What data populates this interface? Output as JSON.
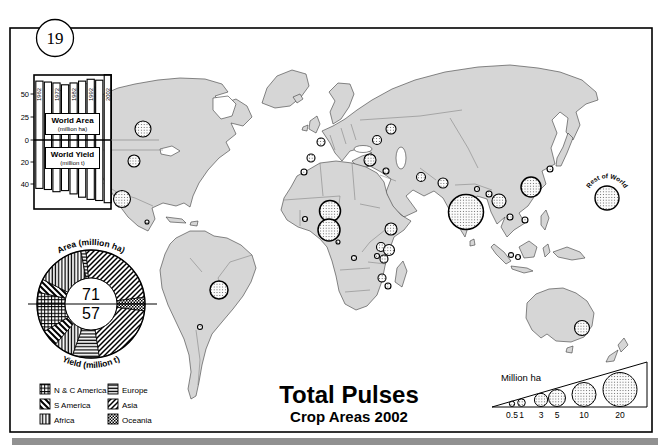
{
  "figure": {
    "number": "19",
    "title": "Total Pulses",
    "subtitle": "Crop Areas 2002"
  },
  "colors": {
    "land": "#d6d6d6",
    "coast": "#3a3a3a",
    "inner_border": "#6a6a6a",
    "frame": "#000000",
    "bubble_dot": "#444444",
    "bottom_band": "#919191"
  },
  "legend": {
    "items": [
      {
        "label": "N & C America",
        "pattern": "grid"
      },
      {
        "label": "S America",
        "pattern": "bdiag"
      },
      {
        "label": "Africa",
        "pattern": "vlines"
      },
      {
        "label": "Europe",
        "pattern": "hlines"
      },
      {
        "label": "Asia",
        "pattern": "fdiag"
      },
      {
        "label": "Oceania",
        "pattern": "dense"
      }
    ]
  },
  "chart_data": [
    {
      "type": "bar",
      "title": "World Area and World Yield of pulses by year",
      "top_series": {
        "name": "World Area",
        "unit": "(million ha)"
      },
      "bottom_series": {
        "name": "World Yield",
        "unit": "(million t)"
      },
      "years": [
        1962,
        1967,
        1972,
        1977,
        1982,
        1987,
        1992,
        1997,
        2002
      ],
      "area_million_ha": [
        64,
        63,
        62,
        60,
        62,
        64,
        66,
        65,
        71
      ],
      "yield_million_t": [
        44,
        45,
        47,
        46,
        49,
        52,
        54,
        55,
        57
      ],
      "y_ticks_top": [
        50,
        25,
        0
      ],
      "y_ticks_bottom": [
        20,
        40
      ],
      "ylim_top": [
        0,
        72
      ],
      "ylim_bottom": [
        0,
        60
      ],
      "grid": false,
      "year_labels_shown": [
        1962,
        1972,
        1982,
        1992,
        2002
      ]
    },
    {
      "type": "pie",
      "top_label": "Area (million ha)",
      "bottom_label": "Yield (million t)",
      "area_total": 71,
      "yield_total": 57,
      "regions": [
        "N & C America",
        "S America",
        "Africa",
        "Europe",
        "Asia",
        "Oceania"
      ],
      "patterns": [
        "grid",
        "bdiag",
        "vlines",
        "hlines",
        "fdiag",
        "dense"
      ],
      "area_pct": [
        7,
        8,
        29,
        3,
        49,
        4
      ],
      "yield_pct": [
        17,
        10,
        12,
        16,
        41,
        4
      ]
    },
    {
      "type": "scatter",
      "title": "Pulses crop area 2002 by country (proportional circles)",
      "unit": "Million ha",
      "scale": {
        "label": "Million ha",
        "values": [
          0.5,
          1,
          3,
          5,
          10,
          20
        ]
      },
      "rest_of_world_label": "Rest of World",
      "rest_of_world": {
        "x": 607,
        "y": 198,
        "r": 12
      },
      "points": [
        {
          "name": "Canada",
          "x": 143,
          "y": 129,
          "r": 8
        },
        {
          "name": "USA",
          "x": 134,
          "y": 161,
          "r": 6
        },
        {
          "name": "Mexico",
          "x": 122,
          "y": 199,
          "r": 8.5
        },
        {
          "name": "Central America",
          "x": 147,
          "y": 222,
          "r": 2
        },
        {
          "name": "Brazil",
          "x": 219,
          "y": 290,
          "r": 9
        },
        {
          "name": "Argentina",
          "x": 200,
          "y": 327,
          "r": 2.5
        },
        {
          "name": "Spain",
          "x": 311,
          "y": 158,
          "r": 4
        },
        {
          "name": "France",
          "x": 321,
          "y": 142,
          "r": 4
        },
        {
          "name": "Morocco",
          "x": 304,
          "y": 172,
          "r": 3
        },
        {
          "name": "Ukraine",
          "x": 377,
          "y": 140,
          "r": 4.5
        },
        {
          "name": "Russia",
          "x": 391,
          "y": 129,
          "r": 5
        },
        {
          "name": "Turkey",
          "x": 370,
          "y": 160,
          "r": 6
        },
        {
          "name": "Syria",
          "x": 386,
          "y": 171,
          "r": 3
        },
        {
          "name": "Iran",
          "x": 421,
          "y": 177,
          "r": 4.5
        },
        {
          "name": "Pakistan",
          "x": 443,
          "y": 183,
          "r": 5
        },
        {
          "name": "India",
          "x": 466,
          "y": 212,
          "r": 17.5
        },
        {
          "name": "Nepal",
          "x": 477,
          "y": 189,
          "r": 2.5
        },
        {
          "name": "Bangladesh",
          "x": 489,
          "y": 194,
          "r": 3
        },
        {
          "name": "Myanmar",
          "x": 499,
          "y": 201,
          "r": 7
        },
        {
          "name": "China",
          "x": 531,
          "y": 187,
          "r": 10
        },
        {
          "name": "Korea-Japan",
          "x": 550,
          "y": 169,
          "r": 3
        },
        {
          "name": "Thailand",
          "x": 510,
          "y": 217,
          "r": 3
        },
        {
          "name": "Vietnam",
          "x": 525,
          "y": 220,
          "r": 3
        },
        {
          "name": "Indonesia west",
          "x": 511,
          "y": 255,
          "r": 2.5
        },
        {
          "name": "Indonesia east",
          "x": 518,
          "y": 257,
          "r": 2.5
        },
        {
          "name": "Senegal",
          "x": 305,
          "y": 219,
          "r": 2.5
        },
        {
          "name": "Niger",
          "x": 330,
          "y": 211,
          "r": 10.5
        },
        {
          "name": "Nigeria",
          "x": 329,
          "y": 230,
          "r": 11
        },
        {
          "name": "Cameroon",
          "x": 338,
          "y": 242,
          "r": 2
        },
        {
          "name": "DR Congo",
          "x": 354,
          "y": 258,
          "r": 2.5
        },
        {
          "name": "Ethiopia",
          "x": 391,
          "y": 229,
          "r": 6
        },
        {
          "name": "Uganda",
          "x": 381,
          "y": 247,
          "r": 4.5
        },
        {
          "name": "Kenya",
          "x": 389,
          "y": 250,
          "r": 5.5
        },
        {
          "name": "Rwanda-Burundi",
          "x": 377,
          "y": 256,
          "r": 2.5
        },
        {
          "name": "Tanzania",
          "x": 384,
          "y": 259,
          "r": 4
        },
        {
          "name": "Malawi",
          "x": 382,
          "y": 278,
          "r": 4
        },
        {
          "name": "Mozambique",
          "x": 388,
          "y": 286,
          "r": 3
        },
        {
          "name": "Australia",
          "x": 582,
          "y": 328,
          "r": 7.5
        }
      ]
    }
  ]
}
